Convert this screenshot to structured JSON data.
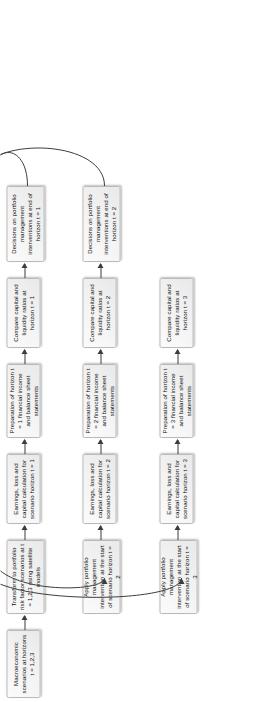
{
  "diagram": {
    "orientation": "rotated-90",
    "colors": {
      "node_fill": "#f2f2f2",
      "node_border": "#b9b9b9",
      "arrow": "#3c3c3c",
      "text": "#111111",
      "background": "#ffffff"
    },
    "lanes": [
      {
        "id": "horizon-1",
        "horizon": "t = 1",
        "nodes": [
          {
            "id": "macro-scenarios",
            "label": "Macroeconomic scenarios at horizons t = 1,2,3"
          },
          {
            "id": "transform-risk-factors",
            "label": "Transform to portfolio risk factor scenarios at t = 1,2,3 using satellite models"
          },
          {
            "id": "earnings-loss-capital-1",
            "label": "Earnings, loss and capital calculation for scenario horizon t = 1"
          },
          {
            "id": "preparation-statements-1",
            "label": "Preparation of horizon t = 1 financial income and balance sheet statements"
          },
          {
            "id": "compare-ratios-1",
            "label": "Compare capital and liquidity ratios at horizon t = 1"
          },
          {
            "id": "decisions-interventions-1",
            "label": "Decisions on portfolio management interventions at end of horizon t = 1"
          }
        ]
      },
      {
        "id": "horizon-2",
        "horizon": "t = 2",
        "nodes": [
          {
            "id": "apply-intervention-2",
            "label": "Apply portfolio management intervention at the start of scenario horizon t = 2"
          },
          {
            "id": "earnings-loss-capital-2",
            "label": "Earnings, loss and capital calculation for scenario horizon t = 2"
          },
          {
            "id": "preparation-statements-2",
            "label": "Preparation of horizon t = 2 financial income and balance sheet statements"
          },
          {
            "id": "compare-ratios-2",
            "label": "Compare capital and liquidity ratios at horizon t = 2"
          },
          {
            "id": "decisions-interventions-2",
            "label": "Decisions on portfolio management interventions at end of horizon t = 2"
          }
        ]
      },
      {
        "id": "horizon-3",
        "horizon": "t = 3",
        "nodes": [
          {
            "id": "apply-intervention-3",
            "label": "Apply portfolio management intervention at the start of scenario horizon t = 3"
          },
          {
            "id": "earnings-loss-capital-3",
            "label": "Earnings, loss and capital calculation for scenario horizon t = 3"
          },
          {
            "id": "preparation-statements-3",
            "label": "Preparation of horizon t = 3 financial income and balance sheet statements"
          },
          {
            "id": "compare-ratios-3",
            "label": "Compare capital and liquidity ratios at horizon t = 3"
          }
        ]
      }
    ],
    "connectors": [
      {
        "id": "macro-to-transform",
        "type": "straight-arrow",
        "from": "macro-scenarios",
        "to": "transform-risk-factors"
      },
      {
        "id": "transform-to-earnings-1",
        "type": "straight-arrow",
        "from": "transform-risk-factors",
        "to": "earnings-loss-capital-1"
      },
      {
        "id": "earnings-1-to-prep-1",
        "type": "straight-arrow",
        "from": "earnings-loss-capital-1",
        "to": "preparation-statements-1"
      },
      {
        "id": "prep-1-to-compare-1",
        "type": "straight-arrow",
        "from": "preparation-statements-1",
        "to": "compare-ratios-1"
      },
      {
        "id": "compare-1-to-decisions-1",
        "type": "straight-arrow",
        "from": "compare-ratios-1",
        "to": "decisions-interventions-1"
      },
      {
        "id": "decisions-1-to-apply-2",
        "type": "feedback-loop",
        "from": "decisions-interventions-1",
        "to": "apply-intervention-2"
      },
      {
        "id": "apply-2-to-earnings-2",
        "type": "straight-arrow",
        "from": "apply-intervention-2",
        "to": "earnings-loss-capital-2"
      },
      {
        "id": "earnings-2-to-prep-2",
        "type": "straight-arrow",
        "from": "earnings-loss-capital-2",
        "to": "preparation-statements-2"
      },
      {
        "id": "prep-2-to-compare-2",
        "type": "straight-arrow",
        "from": "preparation-statements-2",
        "to": "compare-ratios-2"
      },
      {
        "id": "compare-2-to-decisions-2",
        "type": "straight-arrow",
        "from": "compare-ratios-2",
        "to": "decisions-interventions-2"
      },
      {
        "id": "decisions-2-to-apply-3",
        "type": "feedback-loop",
        "from": "decisions-interventions-2",
        "to": "apply-intervention-3"
      },
      {
        "id": "apply-3-to-earnings-3",
        "type": "straight-arrow",
        "from": "apply-intervention-3",
        "to": "earnings-loss-capital-3"
      },
      {
        "id": "earnings-3-to-prep-3",
        "type": "straight-arrow",
        "from": "earnings-loss-capital-3",
        "to": "preparation-statements-3"
      },
      {
        "id": "prep-3-to-compare-3",
        "type": "straight-arrow",
        "from": "preparation-statements-3",
        "to": "compare-ratios-3"
      }
    ]
  }
}
